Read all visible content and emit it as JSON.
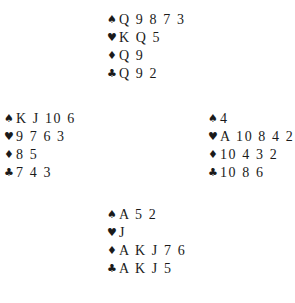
{
  "hands": {
    "north": {
      "spades": "Q 9 8 7 3",
      "hearts": "K Q 5",
      "diamonds": "Q 9",
      "clubs": "Q 9 2"
    },
    "west": {
      "spades": "K J 10 6",
      "hearts": "9 7 6 3",
      "diamonds": "8 5",
      "clubs": "7 4 3"
    },
    "east": {
      "spades": "4",
      "hearts": "A 10 8 4 2",
      "diamonds": "10 4 3 2",
      "clubs": "10 8 6"
    },
    "south": {
      "spades": "A 5 2",
      "hearts": "J",
      "diamonds": "A K J 7 6",
      "clubs": "A K J 5"
    }
  },
  "suits": {
    "spades": "♠",
    "hearts": "♥",
    "diamonds": "♦",
    "clubs": "♣"
  }
}
